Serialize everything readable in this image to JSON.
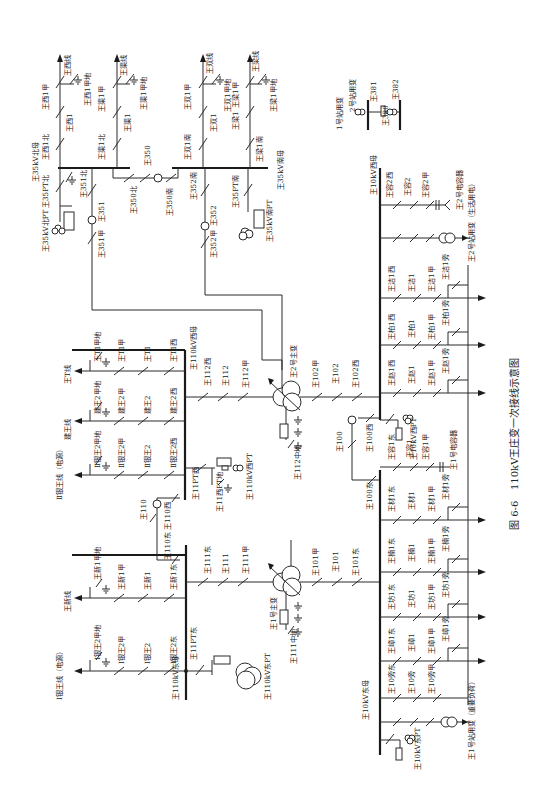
{
  "caption": {
    "figure_no": "图 6-6",
    "title": "110kV王庄变一次接线示意图"
  },
  "orientation": "rotated 90° counter-clockwise",
  "buses": {
    "b35_north": "王35kV北母",
    "b35_south": "王35kV南母",
    "b110_west": "王110kV西母",
    "b110_east": "王110kV东母",
    "b10_west": "王10kV西母",
    "b10_east": "王10kV东母"
  },
  "kv35": {
    "north_pt": {
      "sw": "王35PT北",
      "pt": "王35kV北PT"
    },
    "south_pt": {
      "sw": "王35PT南",
      "pt": "王35kV南PT"
    },
    "feeders": [
      {
        "line": "王西线",
        "bus_sw": "王西1北",
        "brk": "王西1",
        "line_sw": "王西1甲",
        "earth": "王西1甲地"
      },
      {
        "line": "王渠线",
        "bus_sw": "王渠1北",
        "brk": "王渠1",
        "line_sw": "王渠1甲",
        "earth": "王渠1甲地"
      },
      {
        "line": "王双线",
        "bus_sw": "王双1南",
        "brk": "王双1",
        "line_sw": "王双1甲",
        "earth": "王双1甲地"
      },
      {
        "line": "王梁线",
        "bus_sw": "王梁1南",
        "brk": "王梁1",
        "line_sw": "王梁1甲",
        "earth": "王梁1甲地"
      }
    ],
    "bus_tie": {
      "north_sw": "王350北",
      "brk": "王350",
      "south_sw": "王350南"
    },
    "incomer1": {
      "bus_sw": "王351北",
      "brk": "王351",
      "tx_sw": "王351甲"
    },
    "incomer2": {
      "bus_sw": "王352南",
      "brk": "王352",
      "tx_sw": "王352甲"
    }
  },
  "kv110": {
    "west_feeders": [
      {
        "line": "王T线",
        "bus_sw": "王T1西",
        "brk": "王T1",
        "line_sw": "王T1甲",
        "earth": "王T1甲地"
      },
      {
        "line": "建王线",
        "bus_sw": "建王2西",
        "brk": "建王2",
        "line_sw": "建王2甲",
        "earth": "建王2甲地"
      },
      {
        "line": "Ⅱ银王线（电源）",
        "bus_sw": "Ⅱ银王2西",
        "brk": "Ⅱ银王2",
        "line_sw": "Ⅱ银王2甲",
        "earth": "Ⅱ银王2甲地"
      }
    ],
    "east_feeders": [
      {
        "line": "王新线",
        "bus_sw": "王新1东",
        "brk": "王新1",
        "line_sw": "王新1甲",
        "earth": "王新1甲地"
      },
      {
        "line": "Ⅰ银王线（电源）",
        "bus_sw": "Ⅰ银王2东",
        "brk": "Ⅰ银王2",
        "line_sw": "Ⅰ银王2甲",
        "earth": "Ⅰ银王2甲地"
      }
    ],
    "west_pt": {
      "sw": "王11PT西",
      "earth": "王11西PT地",
      "pt": "王110kV西PT"
    },
    "east_pt": {
      "sw": "王11PT东",
      "pt": "王110kV东PT"
    },
    "bus_tie": {
      "west_sw": "王110西",
      "brk": "王110",
      "east_sw": "王110东"
    },
    "tx2_bay": {
      "bus_sw": "王112西",
      "brk": "王112",
      "tx_sw": "王112甲"
    },
    "tx1_bay": {
      "bus_sw": "王111东",
      "brk": "王111",
      "tx_sw": "王111甲"
    }
  },
  "transformers": {
    "t2": {
      "name": "王2号主变",
      "neutral": "王112中地",
      "lv_tx_sw": "王102甲",
      "lv_brk": "王102",
      "lv_bus_sw": "王102西"
    },
    "t1": {
      "name": "王1号主变",
      "neutral": "王111中地",
      "lv_tx_sw": "王101甲",
      "lv_brk": "王101",
      "lv_bus_sw": "王101东"
    }
  },
  "kv10": {
    "bus_tie": {
      "west_sw": "王100西",
      "brk": "王100",
      "east_sw": "王100东"
    },
    "west_pt": "王10kV西PT",
    "east_pt": "王10kV东PT",
    "west_feeders": [
      {
        "bus_sw": "王洁1西",
        "brk": "王洁1",
        "line_sw": "王洁1甲",
        "bypass": "王洁1旁"
      },
      {
        "bus_sw": "王柏1西",
        "brk": "王柏1",
        "line_sw": "王柏1甲",
        "bypass": "王柏1旁"
      },
      {
        "bus_sw": "王赵1西",
        "brk": "王赵1",
        "line_sw": "王赵1甲",
        "bypass": "王赵1旁"
      }
    ],
    "east_feeders": [
      {
        "bus_sw": "王材1东",
        "brk": "王材1",
        "line_sw": "王材1甲",
        "bypass": "王材1旁"
      },
      {
        "bus_sw": "王楠1东",
        "brk": "王楠1",
        "line_sw": "王楠1甲",
        "bypass": "王楠1旁"
      },
      {
        "bus_sw": "王坊1东",
        "brk": "王坊1",
        "line_sw": "王坊1甲",
        "bypass": "王坊1旁"
      },
      {
        "bus_sw": "王嶂1东",
        "brk": "王嶂1",
        "line_sw": "王嶂1甲",
        "bypass": "王嶂1旁"
      }
    ],
    "bypass_bay": {
      "bus_sw": "王10旁东",
      "brk": "王10旁",
      "line_sw": "王10旁甲"
    },
    "cap2": {
      "bus_sw": "王容2西",
      "brk": "王容2",
      "line_sw": "王容2甲",
      "name": "王2号电容器"
    },
    "cap1": {
      "bus_sw": "王容1东",
      "brk": "王容1",
      "line_sw": "王容1甲",
      "name": "王1号电容器"
    },
    "aux2": "王2号站用变（生活用电）",
    "aux1": "王1号站用变（重要负荷）"
  },
  "station_aux_380": {
    "aux1": "1号站用变",
    "aux2": "2号站用变",
    "sw1": "王381",
    "sw2": "王382",
    "tie": "王380"
  },
  "colors": {
    "line": "#2a2a2a",
    "background": "#ffffff",
    "text": "#222222"
  }
}
